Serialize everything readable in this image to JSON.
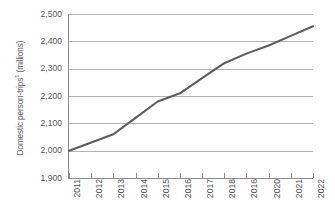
{
  "chart_data": {
    "type": "line",
    "title": "",
    "xlabel": "",
    "ylabel": "Domestic person-trips",
    "ylabel_superscript": "1",
    "ylabel_units": "(millions)",
    "ylabel_full": "Domestic person-trips¹ (millions)",
    "categories": [
      "2011",
      "2012",
      "2013",
      "2014",
      "2015",
      "2016",
      "2017",
      "2018",
      "2016",
      "2020",
      "2021",
      "2022"
    ],
    "values": [
      2000,
      2030,
      2060,
      2120,
      2180,
      2210,
      2265,
      2320,
      2355,
      2385,
      2420,
      2455
    ],
    "ytick_labels": [
      "2,500",
      "2,400",
      "2,300",
      "2,200",
      "2,100",
      "2,000",
      "1,900"
    ],
    "ytick_values": [
      2500,
      2400,
      2300,
      2200,
      2100,
      2000,
      1900
    ],
    "ylim": [
      1900,
      2500
    ],
    "grid": true,
    "legend": "none",
    "series": [
      {
        "name": "Domestic person-trips",
        "values": [
          2000,
          2030,
          2060,
          2120,
          2180,
          2210,
          2265,
          2320,
          2355,
          2385,
          2420,
          2455
        ]
      }
    ],
    "colors": {
      "line": "#5d5d60",
      "gridline": "#b4b4b6",
      "axis": "#8d8d8f",
      "text": "#58585a",
      "background": "#ffffff"
    }
  }
}
